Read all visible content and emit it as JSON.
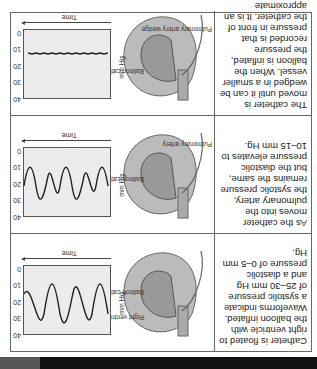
{
  "rows": [
    {
      "text": "Catheter is floated to right ventricle with the balloon inflated. Waveforms indicate a systolic pressure of 25–30 mm Hg and a diastolic pressure of 0–5 mm Hg.",
      "labels": {
        "a": "Right ventricle",
        "b": "Balloon catheter"
      },
      "graph": {
        "y_label": "mm Hg",
        "x_label": "Time",
        "ticks": [
          "40",
          "30",
          "20",
          "10",
          "0"
        ]
      }
    },
    {
      "text": "As the catheter moves into the pulmonary artery, the systolic pressure remains the same, but the diastolic pressure elevates to 10–15 mm Hg.",
      "labels": {
        "a": "Pulmonary artery",
        "b": "Balloon catheter"
      },
      "graph": {
        "y_label": "mm Hg",
        "x_label": "Time",
        "ticks": [
          "40",
          "30",
          "20",
          "10",
          "0"
        ]
      }
    },
    {
      "text": "The catheter is moved until it can be wedged in a smaller vessel. When the balloon is inflated, the pressure recorded is that pressure in front of the catheter. It is an approximate measure of the left ventricular end-diastolic pressure.",
      "labels": {
        "a": "Pulmonary artery wedge",
        "b": "Balloon catheter"
      },
      "graph": {
        "y_label": "mm Hg",
        "x_label": "Time",
        "ticks": [
          "40",
          "30",
          "20",
          "10",
          "0"
        ]
      }
    }
  ]
}
